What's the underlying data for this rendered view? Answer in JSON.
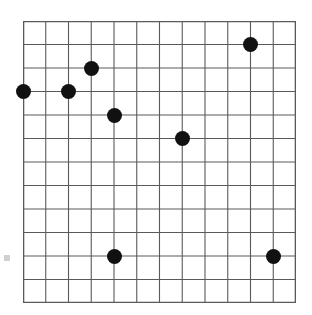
{
  "figure": {
    "title": "",
    "background_color": "#ffffff",
    "marker_color": "#111111",
    "grid_color": "#5a5a5a",
    "border_color": "#5a5a5a",
    "edge_mark_color": "#c8c8c8",
    "edge_mark_label": "axis-tick-artifact"
  },
  "chart_data": {
    "type": "scatter",
    "title": "",
    "xlabel": "",
    "ylabel": "",
    "xlim": [
      0,
      12
    ],
    "ylim": [
      0,
      12
    ],
    "grid": true,
    "grid_columns": 12,
    "grid_rows": 12,
    "legend": null,
    "xticklabels": [],
    "yticklabels": [],
    "marker": "circle",
    "marker_size": 15,
    "marker_color": "#111111",
    "x": [
      0,
      2,
      3,
      4,
      7,
      10,
      4,
      11
    ],
    "y": [
      9,
      9,
      10,
      8,
      7,
      11,
      2,
      2
    ],
    "points": [
      {
        "label": "point-1",
        "x": 0,
        "y": 9,
        "col": 0,
        "row": 3
      },
      {
        "label": "point-2",
        "x": 2,
        "y": 9,
        "col": 2,
        "row": 3
      },
      {
        "label": "point-3",
        "x": 3,
        "y": 10,
        "col": 3,
        "row": 2
      },
      {
        "label": "point-4",
        "x": 4,
        "y": 8,
        "col": 4,
        "row": 4
      },
      {
        "label": "point-5",
        "x": 7,
        "y": 7,
        "col": 7,
        "row": 5
      },
      {
        "label": "point-6",
        "x": 10,
        "y": 11,
        "col": 10,
        "row": 1
      },
      {
        "label": "point-7",
        "x": 4,
        "y": 2,
        "col": 4,
        "row": 10
      },
      {
        "label": "point-8",
        "x": 11,
        "y": 2,
        "col": 11,
        "row": 10
      }
    ]
  }
}
